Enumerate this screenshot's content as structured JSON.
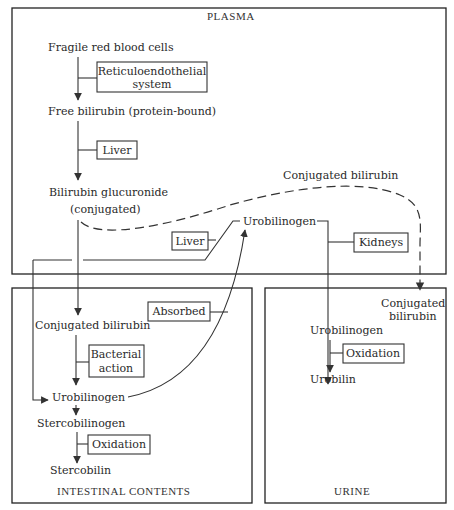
{
  "compartments": {
    "plasma": "PLASMA",
    "intestinal": "INTESTINAL CONTENTS",
    "urine": "URINE"
  },
  "plasma": {
    "fragile_rbc": "Fragile red blood cells",
    "re_system_line1": "Reticuloendothelial",
    "re_system_line2": "system",
    "free_bilirubin": "Free bilirubin (protein-bound)",
    "liver_1": "Liver",
    "bilirubin_glucuronide": "Bilirubin glucuronide",
    "conjugated_paren": "(conjugated)",
    "conjugated_bilirubin_dashed": "Conjugated bilirubin",
    "urobilinogen": "Urobilinogen",
    "liver_2": "Liver",
    "kidneys": "Kidneys"
  },
  "intestinal": {
    "absorbed": "Absorbed",
    "conjugated_bilirubin": "Conjugated bilirubin",
    "bacterial_line1": "Bacterial",
    "bacterial_line2": "action",
    "urobilinogen": "Urobilinogen",
    "stercobilinogen": "Stercobilinogen",
    "oxidation": "Oxidation",
    "stercobilin": "Stercobilin"
  },
  "urine": {
    "conjugated_line1": "Conjugated",
    "conjugated_line2": "bilirubin",
    "urobilinogen": "Urobilinogen",
    "oxidation": "Oxidation",
    "urobilin": "Urobilin"
  }
}
